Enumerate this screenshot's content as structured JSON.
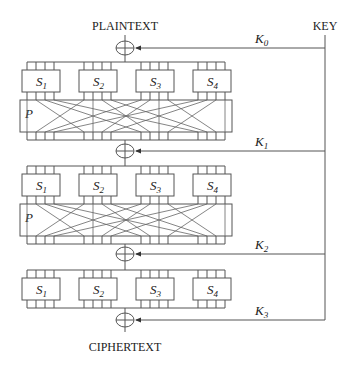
{
  "diagram": {
    "input_label": "PLAINTEXT",
    "output_label": "CIPHERTEXT",
    "key_label": "KEY",
    "permutation_label": "P",
    "round_keys": [
      {
        "name": "K",
        "sub": "0"
      },
      {
        "name": "K",
        "sub": "1"
      },
      {
        "name": "K",
        "sub": "2"
      },
      {
        "name": "K",
        "sub": "3"
      }
    ],
    "sbox_rounds": [
      {
        "sboxes": [
          {
            "name": "S",
            "sub": "1"
          },
          {
            "name": "S",
            "sub": "2"
          },
          {
            "name": "S",
            "sub": "3"
          },
          {
            "name": "S",
            "sub": "4"
          }
        ],
        "has_permutation": true
      },
      {
        "sboxes": [
          {
            "name": "S",
            "sub": "1"
          },
          {
            "name": "S",
            "sub": "2"
          },
          {
            "name": "S",
            "sub": "3"
          },
          {
            "name": "S",
            "sub": "4"
          }
        ],
        "has_permutation": true
      },
      {
        "sboxes": [
          {
            "name": "S",
            "sub": "1"
          },
          {
            "name": "S",
            "sub": "2"
          },
          {
            "name": "S",
            "sub": "3"
          },
          {
            "name": "S",
            "sub": "4"
          }
        ],
        "has_permutation": false
      }
    ],
    "xor_symbol": "⊕",
    "colors": {
      "line": "#555555",
      "text": "#222222",
      "background": "#ffffff"
    }
  }
}
